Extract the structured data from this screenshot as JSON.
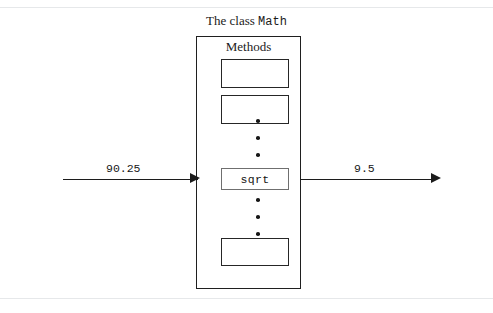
{
  "figure": {
    "caption_prefix": "The class",
    "caption_class_name": "Math",
    "methods_label": "Methods"
  },
  "class_box": {
    "name": "Math",
    "methods": [
      {
        "label": "",
        "kind": "empty-slot"
      },
      {
        "label": "",
        "kind": "empty-slot"
      },
      {
        "label": "sqrt",
        "kind": "named-method"
      },
      {
        "label": "",
        "kind": "empty-slot"
      }
    ],
    "ellipsis_glyph": "vertical-ellipsis",
    "ellipsis_dot_count": 3
  },
  "flow": {
    "input_value": "90.25",
    "output_value": "9.5",
    "input_direction": "right",
    "output_direction": "right"
  },
  "colors": {
    "stroke": "#1f1f1f",
    "method_stroke": "#262626",
    "sqrt_stroke": "#6f6f6f",
    "text": "#1b1b1b",
    "page_rule": "#e6e8ea",
    "background": "#ffffff"
  }
}
